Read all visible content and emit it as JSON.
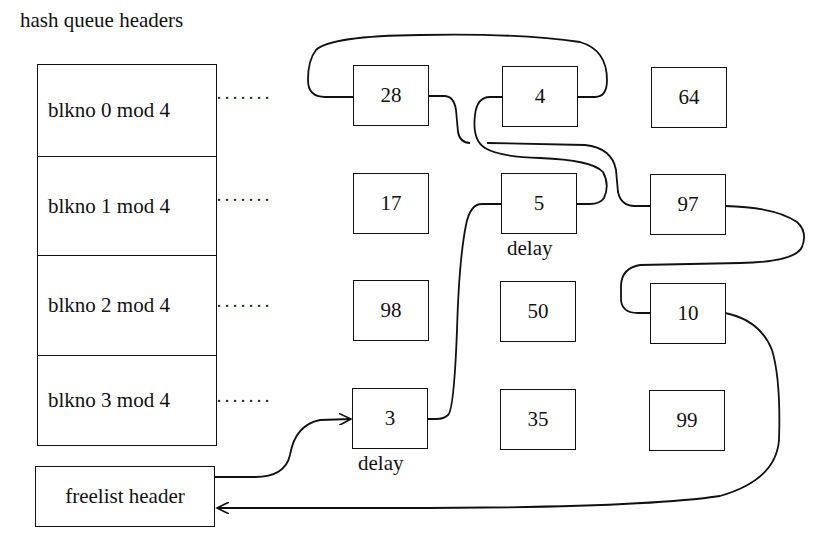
{
  "title": "hash queue headers",
  "hash_queues": [
    {
      "label": "blkno 0 mod 4",
      "buffers": [
        "28",
        "4",
        "64"
      ]
    },
    {
      "label": "blkno 1 mod 4",
      "buffers": [
        "17",
        "5",
        "97"
      ]
    },
    {
      "label": "blkno 2 mod 4",
      "buffers": [
        "98",
        "50",
        "10"
      ]
    },
    {
      "label": "blkno 3 mod 4",
      "buffers": [
        "3",
        "35",
        "99"
      ]
    }
  ],
  "dots": "·······",
  "annotations": {
    "buffer_5": "delay",
    "buffer_3": "delay"
  },
  "freelist": {
    "label": "freelist header",
    "order": [
      "3",
      "5",
      "4",
      "28",
      "97",
      "10"
    ]
  }
}
